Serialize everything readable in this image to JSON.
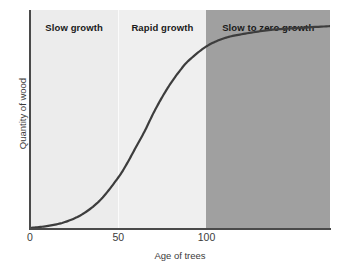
{
  "chart_data": {
    "type": "line",
    "title": "",
    "xlabel": "Age of trees",
    "ylabel": "Quantity of wood",
    "xlim": [
      0,
      170
    ],
    "ylim": [
      0,
      1.08
    ],
    "grid": false,
    "legend": "none",
    "xticks": [
      {
        "value": 0,
        "label": "0"
      },
      {
        "value": 50,
        "label": "50"
      },
      {
        "value": 100,
        "label": "100"
      }
    ],
    "yticks": [],
    "series": [
      {
        "name": "Quantity of wood",
        "color": "#3d3d3d",
        "x": [
          0,
          10,
          20,
          30,
          40,
          50,
          55,
          60,
          65,
          70,
          75,
          80,
          85,
          90,
          100,
          110,
          120,
          135,
          150,
          170
        ],
        "y": [
          0.0,
          0.01,
          0.03,
          0.07,
          0.14,
          0.25,
          0.32,
          0.4,
          0.48,
          0.57,
          0.65,
          0.72,
          0.78,
          0.83,
          0.9,
          0.94,
          0.96,
          0.98,
          0.99,
          1.0
        ]
      }
    ],
    "bands": [
      {
        "id": "slow",
        "label": "Slow growth",
        "x_start": 0,
        "x_end": 50,
        "color": "#ececec"
      },
      {
        "id": "rapid",
        "label": "Rapid growth",
        "x_start": 50,
        "x_end": 100,
        "color": "#efefef"
      },
      {
        "id": "zero",
        "label": "Slow to zero growth",
        "x_start": 100,
        "x_end": 170,
        "color": "#a0a0a0"
      }
    ],
    "annotations": [
      "Slow growth",
      "Rapid growth",
      "Slow to zero growth"
    ],
    "axis_color": "#4a4a4a",
    "curve_color": "#3d3d3d"
  }
}
